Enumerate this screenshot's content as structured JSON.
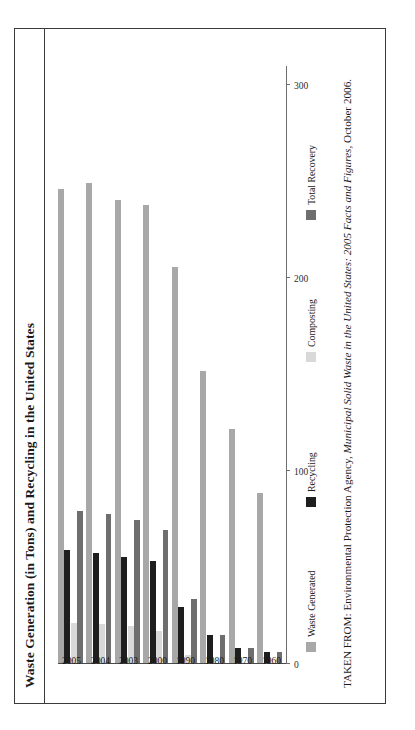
{
  "figure": {
    "title": "Waste Generation (in Tons) and Recycling in the United States",
    "source_prefix": "TAKEN FROM: Environmental Protection Agency, ",
    "source_italic": "Municipal Solid Waste in the United States: 2005 Facts and Figures,",
    "source_suffix": " October 2006."
  },
  "legend": {
    "position": "bottom",
    "items": [
      {
        "label": "Waste Generated",
        "color": "#a8a8a8",
        "swatch_name": "waste-generated-swatch"
      },
      {
        "label": "Recycling",
        "color": "#1e1e1e",
        "swatch_name": "recycling-swatch"
      },
      {
        "label": "Composting",
        "color": "#d9d9d9",
        "swatch_name": "composting-swatch"
      },
      {
        "label": "Total Recovery",
        "color": "#6e6e6e",
        "swatch_name": "total-recovery-swatch"
      }
    ]
  },
  "axis": {
    "value_ticks": [
      "0",
      "100",
      "200",
      "300"
    ],
    "value_tick_values": [
      0,
      100,
      200,
      300
    ],
    "category_labels": [
      "1960",
      "1970",
      "1980",
      "1990",
      "2000",
      "2003",
      "2004",
      "2005"
    ]
  },
  "chart_data": {
    "type": "bar",
    "orientation": "horizontal",
    "title": "Waste Generation (in Tons) and Recycling in the United States",
    "xlabel": "",
    "ylabel": "",
    "xlim": [
      0,
      310
    ],
    "grid": false,
    "legend_position": "bottom",
    "categories": [
      "1960",
      "1970",
      "1980",
      "1990",
      "2000",
      "2003",
      "2004",
      "2005"
    ],
    "series": [
      {
        "name": "Waste Generated",
        "color": "#a8a8a8",
        "values": [
          88.1,
          121.1,
          151.6,
          205.2,
          237.6,
          240.0,
          249.0,
          245.7
        ]
      },
      {
        "name": "Recycling",
        "color": "#1e1e1e",
        "values": [
          5.6,
          8.0,
          14.5,
          29.0,
          52.7,
          55.0,
          57.0,
          58.4
        ]
      },
      {
        "name": "Composting",
        "color": "#d9d9d9",
        "values": [
          0.0,
          0.0,
          0.0,
          4.2,
          16.5,
          19.0,
          20.0,
          20.6
        ]
      },
      {
        "name": "Total Recovery",
        "color": "#6e6e6e",
        "values": [
          5.6,
          8.0,
          14.5,
          33.2,
          69.2,
          74.0,
          77.0,
          79.0
        ]
      }
    ]
  }
}
